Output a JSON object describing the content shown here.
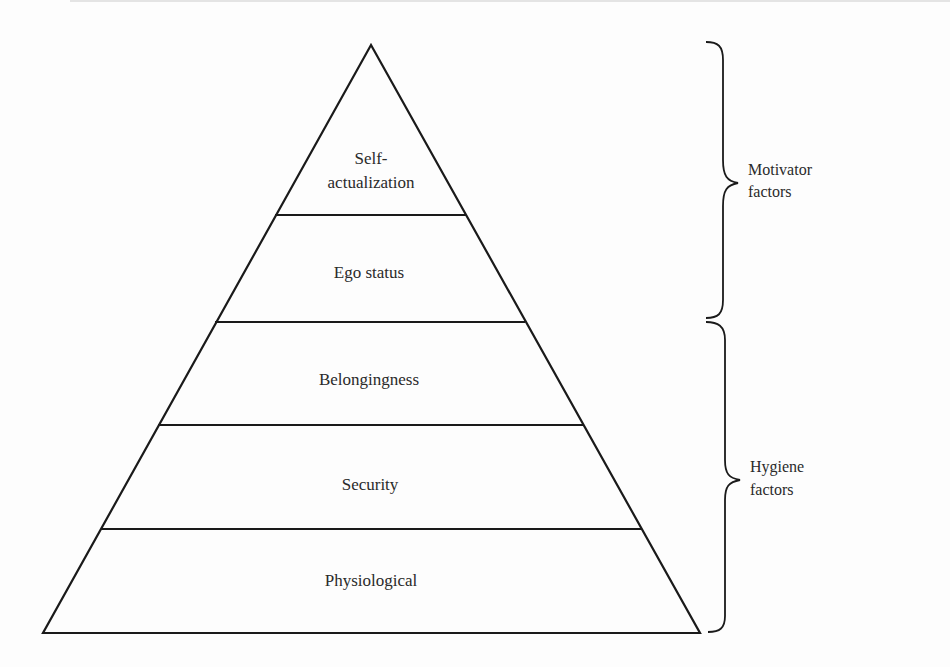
{
  "diagram": {
    "type": "pyramid",
    "levels": [
      {
        "id": "self-actualization",
        "label_line1": "Self-",
        "label_line2": "actualization"
      },
      {
        "id": "ego-status",
        "label": "Ego status"
      },
      {
        "id": "belongingness",
        "label": "Belongingness"
      },
      {
        "id": "security",
        "label": "Security"
      },
      {
        "id": "physiological",
        "label": "Physiological"
      }
    ],
    "groups": [
      {
        "id": "motivator",
        "line1": "Motivator",
        "line2": "factors",
        "covers": [
          "Self-actualization",
          "Ego status"
        ]
      },
      {
        "id": "hygiene",
        "line1": "Hygiene",
        "line2": "factors",
        "covers": [
          "Belongingness",
          "Security",
          "Physiological"
        ]
      }
    ],
    "colors": {
      "stroke": "#1a1a1a",
      "text": "#2a2a2a",
      "background": "#fdfdfd"
    }
  }
}
